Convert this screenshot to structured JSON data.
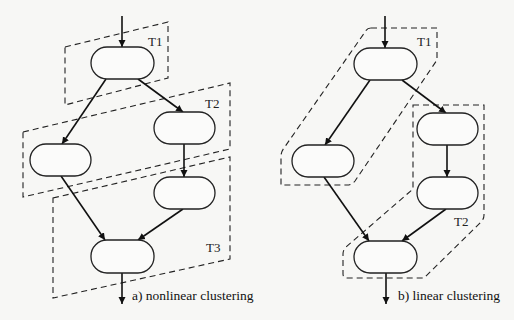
{
  "diagrams": [
    {
      "id": "nonlinear",
      "caption": "a) nonlinear clustering",
      "clusters": [
        {
          "label": "T1"
        },
        {
          "label": "T2"
        },
        {
          "label": "T3"
        }
      ],
      "nodes": [
        "top",
        "right",
        "left",
        "right-lower",
        "bottom"
      ],
      "edges": [
        [
          "entry",
          "top"
        ],
        [
          "top",
          "left"
        ],
        [
          "top",
          "right"
        ],
        [
          "right",
          "right-lower"
        ],
        [
          "left",
          "bottom"
        ],
        [
          "right-lower",
          "bottom"
        ],
        [
          "bottom",
          "exit"
        ]
      ]
    },
    {
      "id": "linear",
      "caption": "b) linear clustering",
      "clusters": [
        {
          "label": "T1"
        },
        {
          "label": "T2"
        }
      ],
      "nodes": [
        "top",
        "right",
        "left",
        "right-lower",
        "bottom"
      ],
      "edges": [
        [
          "entry",
          "top"
        ],
        [
          "top",
          "left"
        ],
        [
          "top",
          "right"
        ],
        [
          "right",
          "right-lower"
        ],
        [
          "left",
          "bottom"
        ],
        [
          "right-lower",
          "bottom"
        ],
        [
          "bottom",
          "exit"
        ]
      ]
    }
  ],
  "colors": {
    "background": "#f7f7f5",
    "stroke": "#222222"
  }
}
